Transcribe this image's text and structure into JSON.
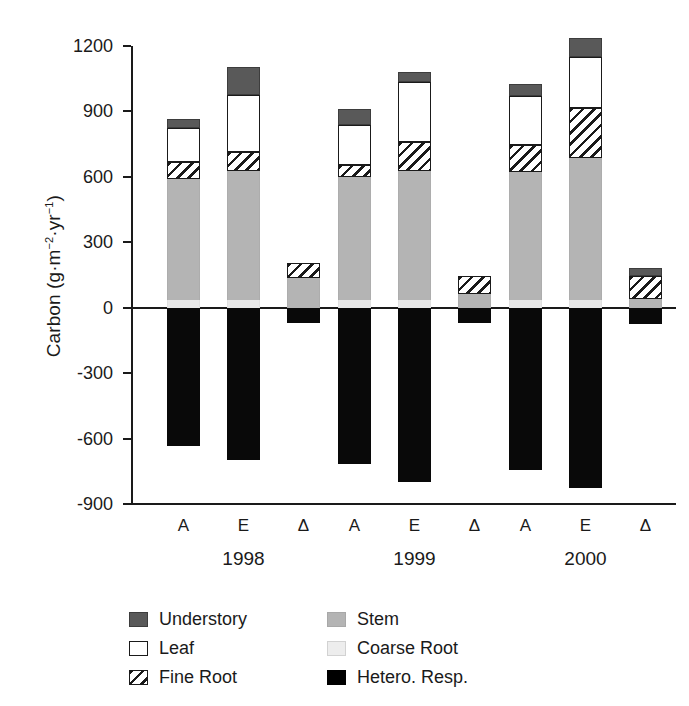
{
  "chart_data": {
    "type": "bar",
    "subtype": "stacked-bar-with-negative",
    "title": "",
    "xlabel": "",
    "ylabel": "Carbon (g-m-2-yr-1)",
    "ylabel_parts": {
      "prefix": "Carbon (g·m",
      "sup1": "−2",
      "mid": "·yr",
      "sup2": "−1",
      "suffix": ")"
    },
    "ylim": [
      -900,
      1200
    ],
    "yticks": [
      1200,
      900,
      600,
      300,
      0,
      -300,
      -600,
      -900
    ],
    "ytick_labels": [
      "1200",
      "900",
      "600",
      "300",
      "0",
      "-300",
      "-600",
      "-900"
    ],
    "grid": false,
    "legend_position": "bottom",
    "groups": [
      "1998",
      "1999",
      "2000"
    ],
    "subcategories": [
      "A",
      "E",
      "Δ"
    ],
    "series": [
      {
        "name": "Coarse Root",
        "key": "coarseroot",
        "color": "#e8e8e8",
        "pattern": "solid"
      },
      {
        "name": "Stem",
        "key": "stem",
        "color": "#b4b4b4",
        "pattern": "solid"
      },
      {
        "name": "Fine Root",
        "key": "fineroot",
        "color": "#ffffff",
        "pattern": "diagonal-hatch"
      },
      {
        "name": "Leaf",
        "key": "leaf",
        "color": "#ffffff",
        "pattern": "solid"
      },
      {
        "name": "Understory",
        "key": "understory",
        "color": "#595959",
        "pattern": "solid"
      },
      {
        "name": "Hetero. Resp.",
        "key": "hetero",
        "color": "#000000",
        "pattern": "solid"
      }
    ],
    "bars": [
      {
        "group": "1998",
        "sub": "A",
        "coarseroot": 35,
        "stem": 555,
        "fineroot": 80,
        "leaf": 155,
        "understory": 40,
        "hetero": -635,
        "total_positive": 865
      },
      {
        "group": "1998",
        "sub": "E",
        "coarseroot": 35,
        "stem": 590,
        "fineroot": 90,
        "leaf": 260,
        "understory": 130,
        "hetero": -700,
        "total_positive": 1105
      },
      {
        "group": "1998",
        "sub": "Δ",
        "coarseroot": 0,
        "stem": 135,
        "fineroot": 70,
        "leaf": 0,
        "understory": 0,
        "hetero": -70,
        "total_positive": 205
      },
      {
        "group": "1999",
        "sub": "A",
        "coarseroot": 35,
        "stem": 565,
        "fineroot": 55,
        "leaf": 185,
        "understory": 70,
        "hetero": -715,
        "total_positive": 910
      },
      {
        "group": "1999",
        "sub": "E",
        "coarseroot": 35,
        "stem": 590,
        "fineroot": 135,
        "leaf": 275,
        "understory": 45,
        "hetero": -800,
        "total_positive": 1080
      },
      {
        "group": "1999",
        "sub": "Δ",
        "coarseroot": 0,
        "stem": 65,
        "fineroot": 80,
        "leaf": 0,
        "understory": 0,
        "hetero": -70,
        "total_positive": 145
      },
      {
        "group": "2000",
        "sub": "A",
        "coarseroot": 35,
        "stem": 585,
        "fineroot": 125,
        "leaf": 225,
        "understory": 55,
        "hetero": -745,
        "total_positive": 1025
      },
      {
        "group": "2000",
        "sub": "E",
        "coarseroot": 35,
        "stem": 650,
        "fineroot": 230,
        "leaf": 235,
        "understory": 85,
        "hetero": -825,
        "total_positive": 1235
      },
      {
        "group": "2000",
        "sub": "Δ",
        "coarseroot": 0,
        "stem": 40,
        "fineroot": 105,
        "leaf": 0,
        "understory": 35,
        "hetero": -75,
        "total_positive": 180
      }
    ]
  },
  "axis": {
    "ytick_labels": [
      "1200",
      "900",
      "600",
      "300",
      "0",
      "-300",
      "-600",
      "-900"
    ],
    "group_labels": [
      "1998",
      "1999",
      "2000"
    ],
    "sub_labels": [
      "A",
      "E",
      "Δ"
    ]
  },
  "legend": {
    "column_1": [
      {
        "label": "Understory",
        "key": "understory"
      },
      {
        "label": "Leaf",
        "key": "leaf"
      },
      {
        "label": "Fine Root",
        "key": "fineroot"
      }
    ],
    "column_2": [
      {
        "label": "Stem",
        "key": "stem"
      },
      {
        "label": "Coarse Root",
        "key": "coarseroot"
      },
      {
        "label": "Hetero. Resp.",
        "key": "hetero"
      }
    ]
  }
}
